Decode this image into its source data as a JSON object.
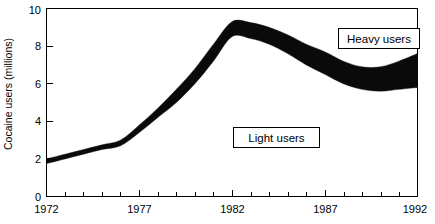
{
  "chart_data": {
    "type": "area",
    "title": "",
    "subtitle": "",
    "xlabel": "",
    "ylabel": "Cocaine users (millions)",
    "xlim": [
      1972,
      1992
    ],
    "ylim": [
      0,
      10
    ],
    "grid": false,
    "legend_position": "inline-annotations",
    "x_tick_labels": [
      "1972",
      "1977",
      "1982",
      "1987",
      "1992"
    ],
    "x_tick_values": [
      1972,
      1977,
      1982,
      1987,
      1992
    ],
    "x_minor_tick_step": 1,
    "y_tick_labels": [
      "0",
      "2",
      "4",
      "6",
      "8",
      "10"
    ],
    "y_tick_values": [
      0,
      2,
      4,
      6,
      8,
      10
    ],
    "series": [
      {
        "name": "Light users",
        "role": "lower-boundary",
        "x": [
          1972,
          1973,
          1974,
          1975,
          1976,
          1977,
          1978,
          1979,
          1980,
          1981,
          1982,
          1983,
          1984,
          1985,
          1986,
          1987,
          1988,
          1989,
          1990,
          1991,
          1992
        ],
        "values": [
          1.75,
          2.0,
          2.25,
          2.5,
          2.7,
          3.4,
          4.2,
          5.0,
          6.0,
          7.2,
          8.5,
          8.4,
          8.1,
          7.6,
          7.0,
          6.5,
          6.0,
          5.7,
          5.6,
          5.7,
          5.8
        ]
      },
      {
        "name": "Heavy users",
        "role": "upper-boundary",
        "x": [
          1972,
          1973,
          1974,
          1975,
          1976,
          1977,
          1978,
          1979,
          1980,
          1981,
          1982,
          1983,
          1984,
          1985,
          1986,
          1987,
          1988,
          1989,
          1990,
          1991,
          1992
        ],
        "values": [
          2.0,
          2.25,
          2.5,
          2.75,
          3.0,
          3.8,
          4.7,
          5.7,
          6.8,
          8.1,
          9.3,
          9.25,
          9.0,
          8.6,
          8.1,
          7.7,
          7.2,
          6.9,
          6.9,
          7.2,
          7.6
        ]
      }
    ],
    "annotations": [
      {
        "label": "Heavy users",
        "x": 1992,
        "y": 8.7,
        "style": "boxed"
      },
      {
        "label": "Light users",
        "x": 1983.5,
        "y": 3.3,
        "style": "boxed"
      }
    ],
    "band_fill_color": "#0a0a0a",
    "axis_color": "#000000",
    "background_color": "#ffffff"
  }
}
